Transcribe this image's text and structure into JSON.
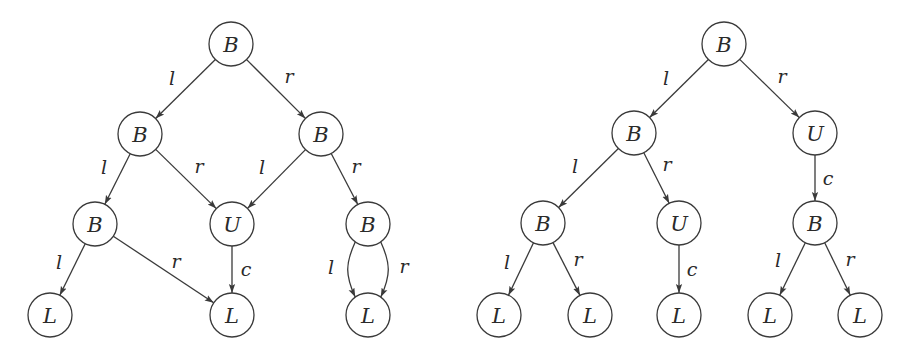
{
  "diagrams": [
    {
      "name": "left-dag",
      "nodes": [
        {
          "id": "n0",
          "label": "B",
          "x": 231,
          "y": 44
        },
        {
          "id": "n1",
          "label": "B",
          "x": 140,
          "y": 134
        },
        {
          "id": "n2",
          "label": "B",
          "x": 321,
          "y": 134
        },
        {
          "id": "n3",
          "label": "B",
          "x": 95,
          "y": 224
        },
        {
          "id": "n4",
          "label": "U",
          "x": 232,
          "y": 224
        },
        {
          "id": "n5",
          "label": "B",
          "x": 368,
          "y": 224
        },
        {
          "id": "n6",
          "label": "L",
          "x": 50,
          "y": 315
        },
        {
          "id": "n7",
          "label": "L",
          "x": 232,
          "y": 315
        },
        {
          "id": "n8",
          "label": "L",
          "x": 368,
          "y": 315
        }
      ],
      "edges": [
        {
          "from": "n0",
          "to": "n1",
          "label": "l",
          "lx": 172,
          "ly": 78
        },
        {
          "from": "n0",
          "to": "n2",
          "label": "r",
          "lx": 289,
          "ly": 76
        },
        {
          "from": "n1",
          "to": "n3",
          "label": "l",
          "lx": 104,
          "ly": 167
        },
        {
          "from": "n1",
          "to": "n4",
          "label": "r",
          "lx": 199,
          "ly": 166
        },
        {
          "from": "n2",
          "to": "n4",
          "label": "l",
          "lx": 262,
          "ly": 167
        },
        {
          "from": "n2",
          "to": "n5",
          "label": "r",
          "lx": 356,
          "ly": 166
        },
        {
          "from": "n3",
          "to": "n6",
          "label": "l",
          "lx": 59,
          "ly": 262
        },
        {
          "from": "n3",
          "to": "n7",
          "label": "r",
          "lx": 176,
          "ly": 261
        },
        {
          "from": "n4",
          "to": "n7",
          "label": "c",
          "lx": 246,
          "ly": 269
        },
        {
          "from": "n5",
          "to": "n8",
          "label": "l",
          "lx": 331,
          "ly": 267,
          "curve": -1
        },
        {
          "from": "n5",
          "to": "n8",
          "label": "r",
          "lx": 404,
          "ly": 266,
          "curve": 1
        }
      ]
    },
    {
      "name": "right-tree",
      "nodes": [
        {
          "id": "m0",
          "label": "B",
          "x": 724,
          "y": 44
        },
        {
          "id": "m1",
          "label": "B",
          "x": 634,
          "y": 133
        },
        {
          "id": "m2",
          "label": "U",
          "x": 815,
          "y": 133
        },
        {
          "id": "m3",
          "label": "B",
          "x": 543,
          "y": 223
        },
        {
          "id": "m4",
          "label": "U",
          "x": 679,
          "y": 223
        },
        {
          "id": "m5",
          "label": "B",
          "x": 815,
          "y": 223
        },
        {
          "id": "m6",
          "label": "L",
          "x": 499,
          "y": 315
        },
        {
          "id": "m7",
          "label": "L",
          "x": 590,
          "y": 315
        },
        {
          "id": "m8",
          "label": "L",
          "x": 679,
          "y": 315
        },
        {
          "id": "m9",
          "label": "L",
          "x": 770,
          "y": 315
        },
        {
          "id": "m10",
          "label": "L",
          "x": 860,
          "y": 315
        }
      ],
      "edges": [
        {
          "from": "m0",
          "to": "m1",
          "label": "l",
          "lx": 666,
          "ly": 78
        },
        {
          "from": "m0",
          "to": "m2",
          "label": "r",
          "lx": 782,
          "ly": 76
        },
        {
          "from": "m1",
          "to": "m3",
          "label": "l",
          "lx": 575,
          "ly": 166
        },
        {
          "from": "m1",
          "to": "m4",
          "label": "r",
          "lx": 667,
          "ly": 164
        },
        {
          "from": "m2",
          "to": "m5",
          "label": "c",
          "lx": 828,
          "ly": 178
        },
        {
          "from": "m3",
          "to": "m6",
          "label": "l",
          "lx": 507,
          "ly": 262
        },
        {
          "from": "m3",
          "to": "m7",
          "label": "r",
          "lx": 578,
          "ly": 259
        },
        {
          "from": "m4",
          "to": "m8",
          "label": "c",
          "lx": 692,
          "ly": 269
        },
        {
          "from": "m5",
          "to": "m9",
          "label": "l",
          "lx": 778,
          "ly": 260
        },
        {
          "from": "m5",
          "to": "m10",
          "label": "r",
          "lx": 850,
          "ly": 259
        }
      ]
    }
  ],
  "style": {
    "node_radius": 22,
    "stroke_color": "#3a3a3a",
    "text_color": "#2a2a2a",
    "background": "#ffffff"
  }
}
